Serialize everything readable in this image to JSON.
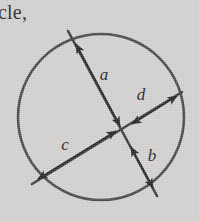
{
  "page": {
    "background_color": "#d4d3d1",
    "ink_color": "#3a3a3a",
    "text_color": "#2a2a2a",
    "width": 199,
    "height": 222
  },
  "context": {
    "partial_text": "cle,"
  },
  "figure": {
    "circle": {
      "center_x": 101,
      "center_y": 117,
      "radius": 83,
      "stroke_width": 2.6,
      "color": "#4a4a4a"
    },
    "chords": [
      {
        "name": "chord-a-b",
        "from_x": 68,
        "from_y": 31,
        "to_x": 157,
        "to_y": 196,
        "stroke_width": 2.6
      },
      {
        "name": "chord-c-d",
        "from_x": 32,
        "from_y": 184,
        "to_x": 182,
        "to_y": 92,
        "stroke_width": 2.6
      }
    ],
    "intersection": {
      "x": 125,
      "y": 136
    },
    "segments": [
      {
        "id": "a",
        "label": "a",
        "label_x": 104,
        "label_y": 80,
        "arrow_from_x": 120,
        "arrow_from_y": 126,
        "arrow_to_x": 76,
        "arrow_to_y": 44,
        "double_headed": true
      },
      {
        "id": "b",
        "label": "b",
        "label_x": 152,
        "label_y": 161,
        "arrow_from_x": 131,
        "arrow_from_y": 147,
        "arrow_to_x": 153,
        "arrow_to_y": 188,
        "double_headed": true
      },
      {
        "id": "c",
        "label": "c",
        "label_x": 65,
        "label_y": 150,
        "arrow_from_x": 116,
        "arrow_from_y": 131,
        "arrow_to_x": 38,
        "arrow_to_y": 179,
        "double_headed": true
      },
      {
        "id": "d",
        "label": "d",
        "label_x": 141,
        "label_y": 100,
        "arrow_from_x": 132,
        "arrow_from_y": 124,
        "arrow_to_x": 177,
        "arrow_to_y": 96,
        "double_headed": true
      }
    ]
  }
}
